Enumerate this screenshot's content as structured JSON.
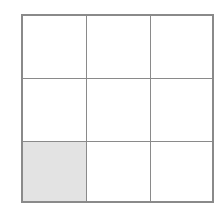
{
  "grid": {
    "rows": 3,
    "cols": 3,
    "line_color": "#8a8a8a",
    "fill_color": "#e3e3e3",
    "cells": [
      {
        "row": 0,
        "col": 0,
        "filled": false
      },
      {
        "row": 0,
        "col": 1,
        "filled": false
      },
      {
        "row": 0,
        "col": 2,
        "filled": false
      },
      {
        "row": 1,
        "col": 0,
        "filled": false
      },
      {
        "row": 1,
        "col": 1,
        "filled": false
      },
      {
        "row": 1,
        "col": 2,
        "filled": false
      },
      {
        "row": 2,
        "col": 0,
        "filled": true
      },
      {
        "row": 2,
        "col": 1,
        "filled": false
      },
      {
        "row": 2,
        "col": 2,
        "filled": false
      }
    ]
  }
}
